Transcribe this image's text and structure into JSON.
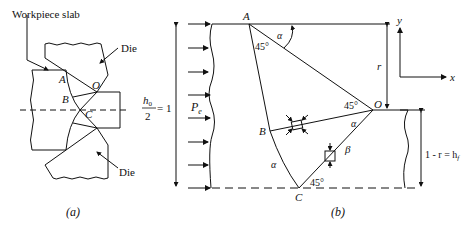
{
  "figure_a": {
    "caption": "(a)",
    "labels": {
      "workpiece": "Workpiece slab",
      "die_top": "Die",
      "die_bottom": "Die",
      "A": "A",
      "B": "B",
      "C": "C",
      "O": "O"
    }
  },
  "figure_b": {
    "caption": "(b)",
    "labels": {
      "A": "A",
      "B": "B",
      "C": "C",
      "O": "O",
      "alpha_top": "α",
      "alpha_ob": "α",
      "alpha_bc": "α",
      "beta": "β",
      "angle_A": "45°",
      "angle_O": "45°",
      "angle_C": "45°",
      "pressure": "P",
      "pressure_sub": "e",
      "h0_num": "h",
      "h0_sub": "0",
      "h0_den": "2",
      "h0_eq": "= 1",
      "r": "r",
      "hf_text": "1 - r = h",
      "hf_sub": "f",
      "axis_x": "x",
      "axis_y": "y"
    }
  },
  "colors": {
    "line": "#111111",
    "background": "#ffffff"
  }
}
